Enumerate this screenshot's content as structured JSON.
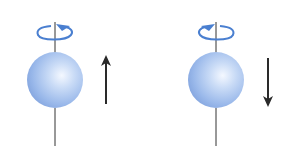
{
  "diagram": {
    "title": "",
    "particles": [
      {
        "id": "spin-up",
        "spin_direction": "up",
        "rotation": "counterclockwise-viewed-from-top"
      },
      {
        "id": "spin-down",
        "spin_direction": "down",
        "rotation": "clockwise-viewed-from-top"
      }
    ],
    "colors": {
      "sphere_light": "#eef4fd",
      "sphere_mid": "#a9c4ee",
      "sphere_dark": "#7d9fd8",
      "rotation_arrow": "#4a7fd0",
      "axis": "#333333",
      "spin_arrow": "#2a2a2a"
    }
  }
}
